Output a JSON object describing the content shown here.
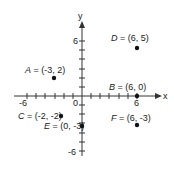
{
  "diagram": {
    "type": "coordinate-plane",
    "axes": {
      "x_label": "x",
      "y_label": "y",
      "x_range": [
        -6,
        6
      ],
      "y_range": [
        -6,
        6
      ],
      "tick_labels": {
        "x_neg": "-6",
        "x_pos": "6",
        "y_pos": "6",
        "y_neg": "-6",
        "origin": "0"
      }
    },
    "points": [
      {
        "name": "A",
        "x": -3,
        "y": 2,
        "label": "A = (-3, 2)"
      },
      {
        "name": "B",
        "x": 6,
        "y": 0,
        "label": "B = (6, 0)"
      },
      {
        "name": "C",
        "x": -2,
        "y": -2,
        "label": "C = (-2, -2)"
      },
      {
        "name": "D",
        "x": 6,
        "y": 5,
        "label": "D = (6, 5)"
      },
      {
        "name": "E",
        "x": 0,
        "y": -3,
        "label": "E = (0, -3)"
      },
      {
        "name": "F",
        "x": 6,
        "y": -3,
        "label": "F = (6, -3)"
      }
    ],
    "colors": {
      "axis": "#333333",
      "point": "#111111",
      "text": "#1a1a1a"
    }
  }
}
